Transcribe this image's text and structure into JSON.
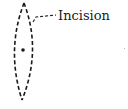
{
  "diagram": {
    "type": "surgical-incision-illustration",
    "label": "Incision",
    "colors": {
      "stroke": "#1a1a1a",
      "background": "#ffffff"
    },
    "shape": {
      "kind": "elliptical-lens",
      "style": "dashed",
      "top_point": [
        24,
        3
      ],
      "bottom_point": [
        22,
        100
      ],
      "center_mark": [
        23,
        50
      ]
    },
    "leader_line": {
      "style": "dashed",
      "from": [
        36,
        22
      ],
      "to": [
        56,
        15
      ]
    }
  }
}
